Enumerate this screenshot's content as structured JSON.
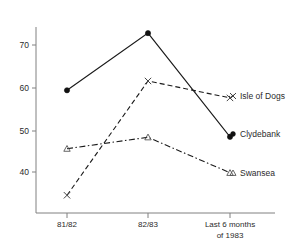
{
  "chart_data": {
    "type": "line",
    "title": "",
    "subtitle": "",
    "xlabel": "",
    "ylabel": "",
    "categories": [
      "81/82",
      "82/83",
      "Last 6 months of 1983"
    ],
    "x_tick_labels": [
      {
        "line1": "81/82",
        "line2": ""
      },
      {
        "line1": "82/83",
        "line2": ""
      },
      {
        "line1": "Last 6 months",
        "line2": "of 1983"
      }
    ],
    "y_tick_labels": [
      "70",
      "60",
      "50",
      "40"
    ],
    "y_tick_values": [
      70,
      60,
      50,
      40
    ],
    "ylim": [
      31,
      76
    ],
    "grid": false,
    "legend_position": "right-inline-labels",
    "series": [
      {
        "name": "Clydebank",
        "marker": "filled-circle",
        "line_style": "solid",
        "values": [
          59.3,
          72.8,
          48.3
        ],
        "label": "Clydebank"
      },
      {
        "name": "Isle of Dogs",
        "marker": "x-cross",
        "line_style": "dashed",
        "values": [
          34.5,
          61.5,
          57.5
        ],
        "label": "Isle of Dogs"
      },
      {
        "name": "Swansea",
        "marker": "open-triangle",
        "line_style": "dash-dot",
        "values": [
          45.5,
          48.2,
          39.8
        ],
        "label": "Swansea"
      }
    ],
    "colors": {
      "line": "#1a1a1a",
      "axis": "#808080",
      "text": "#2b2b2b",
      "background": "#ffffff"
    }
  }
}
